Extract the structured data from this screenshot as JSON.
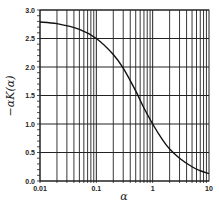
{
  "chart_data": {
    "type": "line",
    "title": "",
    "xlabel": "α",
    "ylabel": "−αK(α)",
    "xscale": "log",
    "xlim": [
      0.01,
      10
    ],
    "ylim": [
      0.0,
      3.0
    ],
    "grid": true,
    "legend": null,
    "x_tick_labels": [
      "0.01",
      "0.1",
      "1",
      "10"
    ],
    "y_tick_labels": [
      "0.0",
      "0.5",
      "1.0",
      "1.5",
      "2.0",
      "2.5",
      "3.0"
    ],
    "series": [
      {
        "name": "−αK(α)",
        "x": [
          0.01,
          0.02,
          0.05,
          0.1,
          0.2,
          0.3,
          0.5,
          0.7,
          1.0,
          1.5,
          2.0,
          3.0,
          5.0,
          7.0,
          10.0
        ],
        "y": [
          2.79,
          2.76,
          2.66,
          2.5,
          2.22,
          1.98,
          1.58,
          1.28,
          1.0,
          0.72,
          0.56,
          0.4,
          0.25,
          0.18,
          0.13
        ]
      }
    ],
    "colors": {
      "line": "#111111",
      "grid": "#222222",
      "background": "#ffffff"
    }
  }
}
